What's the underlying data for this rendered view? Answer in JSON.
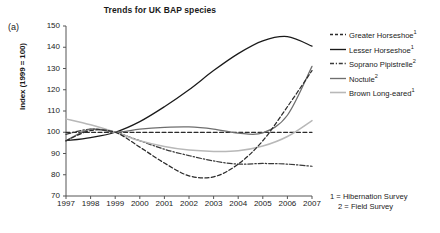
{
  "figure": {
    "panel_label": "(a)",
    "title": "Trends for UK BAP species",
    "y_axis_title": "Index (1999 = 100)",
    "footnote_1": "1 = Hibernation Survey",
    "footnote_2": "2 = Field Survey"
  },
  "legend": {
    "items": [
      {
        "label": "Greater Horseshoe",
        "sup": "1",
        "style": "dashed",
        "color": "#2b2b2b",
        "key": "greater-horseshoe"
      },
      {
        "label": "Lesser Horseshoe",
        "sup": "1",
        "style": "solid",
        "color": "#1a1a1a",
        "key": "lesser-horseshoe"
      },
      {
        "label": "Soprano Pipistrelle",
        "sup": "2",
        "style": "dash-dot",
        "color": "#3a3a3a",
        "key": "soprano-pipistrelle"
      },
      {
        "label": "Noctule",
        "sup": "2",
        "style": "solid-gray",
        "color": "#6e6e6e",
        "key": "noctule"
      },
      {
        "label": "Brown Long-eared",
        "sup": "1",
        "style": "solid-light",
        "color": "#b8b8b8",
        "key": "brown-long-eared"
      }
    ]
  },
  "chart_data": {
    "type": "line",
    "title": "Trends for UK BAP species",
    "xlabel": "",
    "ylabel": "Index (1999 = 100)",
    "xlim": [
      1997,
      2007
    ],
    "ylim": [
      70,
      150
    ],
    "yticks": [
      70,
      80,
      90,
      100,
      110,
      120,
      130,
      140,
      150
    ],
    "grid": false,
    "legend_position": "right",
    "x": [
      1997,
      1998,
      1999,
      2000,
      2001,
      2002,
      2003,
      2004,
      2005,
      2006,
      2007
    ],
    "categories": [
      "1997",
      "1998",
      "1999",
      "2000",
      "2001",
      "2002",
      "2003",
      "2004",
      "2005",
      "2006",
      "2007"
    ],
    "series": [
      {
        "name": "Greater Horseshoe",
        "survey": "Hibernation Survey",
        "linestyle": "dashed",
        "color": "#2b2b2b",
        "values": [
          100,
          100,
          100,
          100,
          100,
          100,
          100,
          100,
          100,
          100,
          100
        ]
      },
      {
        "name": "Lesser Horseshoe",
        "survey": "Hibernation Survey",
        "linestyle": "solid",
        "color": "#1a1a1a",
        "values": [
          96,
          97.5,
          100,
          105,
          112,
          120,
          129,
          137,
          143,
          145,
          140.5
        ]
      },
      {
        "name": "Soprano Pipistrelle",
        "survey": "Field Survey",
        "linestyle": "dash-dot",
        "color": "#3a3a3a",
        "values": [
          99,
          101.5,
          100,
          96,
          92,
          89,
          86.5,
          85,
          85.3,
          85,
          84
        ]
      },
      {
        "name": "Noctule",
        "survey": "Field Survey",
        "linestyle": "solid",
        "color": "#6e6e6e",
        "values": [
          96,
          101.5,
          100,
          101.5,
          102.3,
          102.5,
          101.5,
          99.6,
          99.7,
          108,
          131
        ]
      },
      {
        "name": "Brown Long-eared",
        "survey": "Hibernation Survey",
        "linestyle": "solid",
        "color": "#b8b8b8",
        "values": [
          106.3,
          103.5,
          100,
          96,
          93.3,
          91.6,
          91,
          91.3,
          93.5,
          98,
          105.5
        ]
      },
      {
        "name": "Greater Horseshoe (hibernation dashed dip)",
        "survey": "Hibernation Survey",
        "linestyle": "dashed",
        "color": "#2b2b2b",
        "values": [
          96,
          100.8,
          100,
          93,
          85.5,
          79.5,
          79,
          85,
          96,
          112,
          129
        ]
      }
    ],
    "notes": [
      "1 = Hibernation Survey",
      "2 = Field Survey"
    ]
  },
  "axis": {
    "y_labels": [
      "150",
      "140",
      "130",
      "120",
      "110",
      "100",
      "90",
      "80",
      "70"
    ],
    "x_labels": [
      "1997",
      "1998",
      "1999",
      "2000",
      "2001",
      "2002",
      "2003",
      "2004",
      "2005",
      "2006",
      "2007"
    ]
  }
}
